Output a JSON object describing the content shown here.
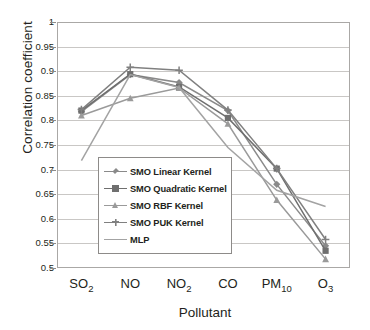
{
  "chart_data": {
    "type": "line",
    "title": "",
    "xlabel": "Pollutant",
    "ylabel": "Correlation coefficient",
    "categories": [
      "SO2",
      "NO",
      "NO2",
      "CO",
      "PM10",
      "O3"
    ],
    "category_labels_html": [
      "SO<sub>2</sub>",
      "NO",
      "NO<sub>2</sub>",
      "CO",
      "PM<sub>10</sub>",
      "O<sub>3</sub>"
    ],
    "ylim": [
      0.5,
      1
    ],
    "ytick_labels": [
      "1",
      "0.95",
      "0.9",
      "0.85",
      "0.8",
      "0.75",
      "0.7",
      "0.65",
      "0.6",
      "0.55",
      "0.5"
    ],
    "ytick_values": [
      1,
      0.95,
      0.9,
      0.85,
      0.8,
      0.75,
      0.7,
      0.65,
      0.6,
      0.55,
      0.5
    ],
    "grid": true,
    "legend_position": "inside-lower-left",
    "series": [
      {
        "name": "SMO Linear Kernel",
        "marker": "diamond",
        "color": "#8a8a8a",
        "values": [
          0.818,
          0.893,
          0.877,
          0.82,
          0.67,
          0.545
        ]
      },
      {
        "name": "SMO Quadratic Kernel",
        "marker": "square",
        "color": "#6f6f6f",
        "values": [
          0.82,
          0.894,
          0.868,
          0.805,
          0.702,
          0.535
        ]
      },
      {
        "name": "SMO RBF Kernel",
        "marker": "triangle",
        "color": "#9a9a9a",
        "values": [
          0.81,
          0.845,
          0.866,
          0.793,
          0.638,
          0.518
        ]
      },
      {
        "name": "SMO PUK Kernel",
        "marker": "cross",
        "color": "#808080",
        "values": [
          0.822,
          0.908,
          0.902,
          0.821,
          0.702,
          0.558
        ]
      },
      {
        "name": "MLP",
        "marker": "line",
        "color": "#a3a3a3",
        "values": [
          0.718,
          0.893,
          0.867,
          0.745,
          0.658,
          0.625
        ]
      }
    ]
  },
  "legend": {
    "items": [
      {
        "label": "SMO Linear Kernel"
      },
      {
        "label": "SMO Quadratic Kernel"
      },
      {
        "label": "SMO RBF Kernel"
      },
      {
        "label": "SMO PUK Kernel"
      },
      {
        "label": "MLP"
      }
    ]
  },
  "axes": {
    "y_title": "Correlation coefficient",
    "x_title": "Pollutant"
  }
}
